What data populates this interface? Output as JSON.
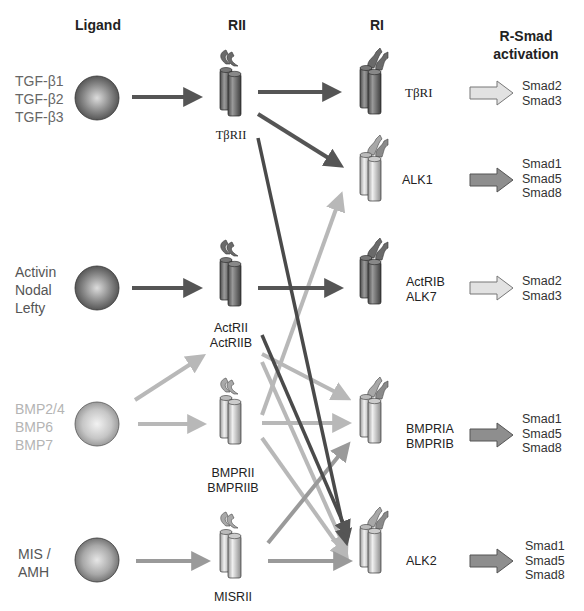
{
  "headers": {
    "ligand": "Ligand",
    "rii": "RII",
    "ri": "RI",
    "rsmad": "R-Smad\nactivation"
  },
  "ligands": [
    {
      "label": "TGF-β1\nTGF-β2\nTGF-β3",
      "shade": "dark",
      "color": "#555555"
    },
    {
      "label": "Activin\nNodal\nLefty",
      "shade": "dark",
      "color": "#555555"
    },
    {
      "label": "BMP2/4\nBMP6\nBMP7",
      "shade": "light",
      "color": "#b0b0b0"
    },
    {
      "label": "MIS /\nAMH",
      "shade": "medium",
      "color": "#555555"
    }
  ],
  "type2_receptors": [
    {
      "label": "TβRII",
      "shade": "dark"
    },
    {
      "label": "ActRII\nActRIIB",
      "shade": "dark"
    },
    {
      "label": "BMPRII\nBMPRIIB",
      "shade": "light"
    },
    {
      "label": "MISRII",
      "shade": "light"
    }
  ],
  "type1_receptors": [
    {
      "label": "TβRI",
      "shade": "dark"
    },
    {
      "label": "ALK1",
      "shade": "light"
    },
    {
      "label": "ActRIB\nALK7",
      "shade": "dark"
    },
    {
      "label": "BMPRIA\nBMPRIB",
      "shade": "light"
    },
    {
      "label": "ALK2",
      "shade": "light"
    }
  ],
  "smads": [
    {
      "label": "Smad2\nSmad3",
      "arrow": "light"
    },
    {
      "label": "Smad1\nSmad5\nSmad8",
      "arrow": "dark"
    },
    {
      "label": "Smad2\nSmad3",
      "arrow": "light"
    },
    {
      "label": "Smad1\nSmad5\nSmad8",
      "arrow": "dark"
    },
    {
      "label": "Smad1\nSmad5\nSmad8",
      "arrow": "dark"
    }
  ],
  "connections": [
    {
      "from": "TGF-β",
      "to": "TβRII",
      "color": "dark"
    },
    {
      "from": "Activin/Nodal/Lefty",
      "to": "ActRII/ActRIIB",
      "color": "dark"
    },
    {
      "from": "BMP",
      "to": "ActRII/ActRIIB",
      "color": "light"
    },
    {
      "from": "BMP",
      "to": "BMPRII/BMPRIIB",
      "color": "light"
    },
    {
      "from": "MIS/AMH",
      "to": "MISRII",
      "color": "medium"
    },
    {
      "from": "TβRII",
      "to": "TβRI",
      "color": "dark"
    },
    {
      "from": "TβRII",
      "to": "ALK1",
      "color": "dark"
    },
    {
      "from": "TβRII",
      "to": "ALK2",
      "color": "dark"
    },
    {
      "from": "ActRII/ActRIIB",
      "to": "ActRIB/ALK7",
      "color": "dark"
    },
    {
      "from": "ActRII/ActRIIB",
      "to": "ALK2",
      "color": "dark"
    },
    {
      "from": "ActRII/ActRIIB",
      "to": "BMPRIA/BMPRIB",
      "color": "light"
    },
    {
      "from": "ActRII/ActRIIB",
      "to": "ALK2",
      "color": "light"
    },
    {
      "from": "BMPRII/BMPRIIB",
      "to": "ALK1",
      "color": "light"
    },
    {
      "from": "BMPRII/BMPRIIB",
      "to": "BMPRIA/BMPRIB",
      "color": "light"
    },
    {
      "from": "BMPRII/BMPRIIB",
      "to": "ALK2",
      "color": "light"
    },
    {
      "from": "MISRII",
      "to": "BMPRIA/BMPRIB",
      "color": "medium"
    },
    {
      "from": "MISRII",
      "to": "ALK2",
      "color": "medium"
    }
  ],
  "colors": {
    "dark_arrow": "#555555",
    "light_arrow": "#b8b8b8",
    "medium_arrow": "#999999"
  }
}
